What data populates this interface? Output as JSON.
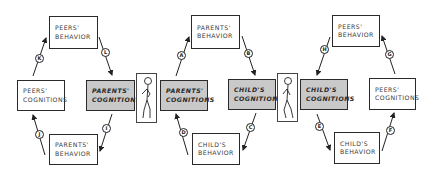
{
  "diagram": {
    "left_cycle": {
      "peers_behavior": [
        "PEERS'",
        "BEHAVIOR"
      ],
      "peers_cognitions": [
        "PEERS'",
        "COGNITIONS"
      ],
      "parents_cognitions": [
        "PARENTS'",
        "COGNITIONS"
      ],
      "parents_behavior": [
        "PARENTS'",
        "BEHAVIOR"
      ],
      "arrows": [
        "K",
        "L",
        "I",
        "J"
      ]
    },
    "middle_cycle": {
      "parents_cognitions": [
        "PARENTS'",
        "COGNITIONS"
      ],
      "parents_behavior": [
        "PARENTS'",
        "BEHAVIOR"
      ],
      "childs_cognitions": [
        "CHILD'S",
        "COGNITIONS"
      ],
      "childs_behavior": [
        "CHILD'S",
        "BEHAVIOR"
      ],
      "arrows": [
        "A",
        "B",
        "C",
        "D"
      ]
    },
    "right_cycle": {
      "childs_cognitions": [
        "CHILD'S",
        "COGNITIONS"
      ],
      "peers_behavior": [
        "PEERS'",
        "BEHAVIOR"
      ],
      "peers_cognitions": [
        "PEERS'",
        "COGNITIONS"
      ],
      "childs_behavior": [
        "CHILD'S",
        "BEHAVIOR"
      ],
      "arrows": [
        "H",
        "G",
        "F",
        "E"
      ]
    },
    "figures": [
      "parent-figure",
      "child-figure"
    ],
    "colors": {
      "cognition_fill": "#c9c9c9",
      "border": "#2a2a2a"
    }
  }
}
